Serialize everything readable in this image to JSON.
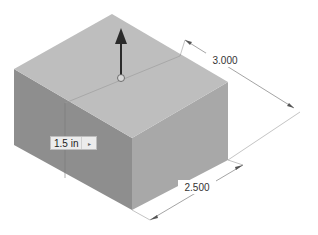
{
  "viewport": {
    "background": "#ffffff",
    "model": {
      "type": "rectangular-box",
      "faces": {
        "top": "#bdbdbd",
        "left": "#8f8f8f",
        "right": "#a9a9a9"
      }
    },
    "extrude_manipulator": {
      "icon": "arrow-up-icon",
      "color": "#2b2b2b"
    }
  },
  "dimensions": {
    "depth": {
      "value": "3.000"
    },
    "width": {
      "value": "2.500"
    }
  },
  "extrude_input": {
    "value": "1.5 in",
    "arrow_icon": "▸"
  }
}
